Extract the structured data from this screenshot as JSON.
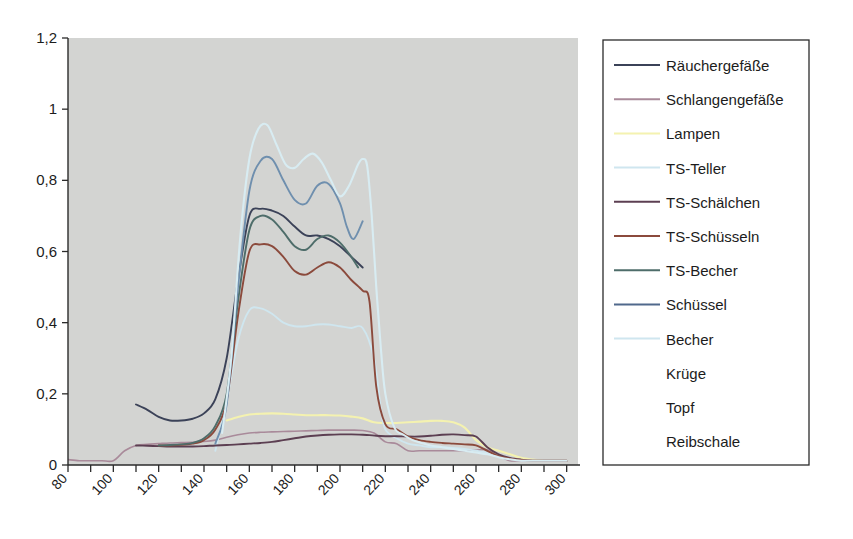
{
  "chart_data": {
    "type": "line",
    "title": "",
    "xlabel": "",
    "ylabel": "",
    "xlim": [
      80,
      305
    ],
    "ylim": [
      0,
      1.2
    ],
    "yticks": [
      0,
      0.2,
      0.4,
      0.6,
      0.8,
      1,
      1.2
    ],
    "ytick_labels": [
      "0",
      "0,2",
      "0,4",
      "0,6",
      "0,8",
      "1",
      "1,2"
    ],
    "xticks": [
      80,
      90,
      100,
      110,
      120,
      130,
      140,
      150,
      160,
      170,
      180,
      190,
      200,
      210,
      220,
      230,
      240,
      250,
      260,
      270,
      280,
      290,
      300
    ],
    "xtick_labels_major": [
      "80",
      "100",
      "120",
      "140",
      "160",
      "180",
      "200",
      "220",
      "240",
      "260",
      "280",
      "300"
    ],
    "xticks_major": [
      80,
      100,
      120,
      140,
      160,
      180,
      200,
      220,
      240,
      260,
      280,
      300
    ],
    "grid": false,
    "legend_position": "right",
    "plot_background": "#d3d4d2",
    "series": [
      {
        "name": "Räuchergefäße",
        "color": "#3b4258",
        "width": 1.9,
        "x": [
          110,
          115,
          120,
          125,
          130,
          135,
          140,
          145,
          150,
          155,
          160,
          165,
          170,
          175,
          180,
          185,
          190,
          195,
          200,
          205,
          210
        ],
        "y": [
          0.17,
          0.155,
          0.135,
          0.125,
          0.125,
          0.13,
          0.145,
          0.185,
          0.3,
          0.52,
          0.7,
          0.72,
          0.715,
          0.7,
          0.67,
          0.645,
          0.645,
          0.635,
          0.615,
          0.585,
          0.555
        ]
      },
      {
        "name": "Schlangengefäße",
        "color": "#a98a9a",
        "width": 1.6,
        "x": [
          80,
          85,
          90,
          95,
          100,
          105,
          110,
          115,
          120,
          125,
          130,
          135,
          140,
          145,
          150,
          155,
          160,
          165,
          170,
          175,
          180,
          185,
          190,
          195,
          200,
          205,
          210,
          215,
          220,
          225,
          230,
          235,
          240,
          245,
          250,
          255,
          260,
          265,
          270,
          275,
          280,
          285,
          290,
          295,
          300
        ],
        "y": [
          0.015,
          0.012,
          0.012,
          0.012,
          0.012,
          0.04,
          0.055,
          0.058,
          0.06,
          0.062,
          0.063,
          0.064,
          0.066,
          0.07,
          0.078,
          0.085,
          0.09,
          0.092,
          0.093,
          0.094,
          0.095,
          0.096,
          0.097,
          0.098,
          0.098,
          0.098,
          0.097,
          0.09,
          0.065,
          0.06,
          0.04,
          0.04,
          0.04,
          0.04,
          0.04,
          0.04,
          0.042,
          0.043,
          0.025,
          0.012,
          0.012,
          0.012,
          0.012,
          0.012,
          0.012
        ]
      },
      {
        "name": "Lampen",
        "color": "#f4f2b0",
        "width": 2.1,
        "x": [
          150,
          155,
          160,
          165,
          170,
          175,
          180,
          185,
          190,
          195,
          200,
          205,
          210,
          215,
          220,
          225,
          230,
          235,
          240,
          245,
          250,
          255,
          260,
          265,
          270,
          275,
          280,
          285,
          290,
          295,
          300
        ],
        "y": [
          0.125,
          0.135,
          0.142,
          0.144,
          0.145,
          0.144,
          0.142,
          0.14,
          0.14,
          0.14,
          0.139,
          0.136,
          0.131,
          0.12,
          0.118,
          0.118,
          0.12,
          0.122,
          0.124,
          0.124,
          0.12,
          0.105,
          0.07,
          0.05,
          0.04,
          0.03,
          0.02,
          0.015,
          0.012,
          0.012,
          0.012
        ]
      },
      {
        "name": "TS-Teller",
        "color": "#cfe6ef",
        "width": 1.9,
        "x": [
          145,
          150,
          155,
          160,
          165,
          170,
          175,
          180,
          185,
          190,
          195,
          200,
          205,
          210,
          215,
          218,
          220,
          225,
          230,
          235,
          240,
          245,
          250,
          255,
          260,
          265,
          270,
          275,
          280,
          285,
          290,
          295,
          300
        ],
        "y": [
          0.04,
          0.18,
          0.35,
          0.435,
          0.44,
          0.425,
          0.4,
          0.39,
          0.39,
          0.395,
          0.395,
          0.39,
          0.385,
          0.385,
          0.3,
          0.16,
          0.1,
          0.075,
          0.06,
          0.055,
          0.05,
          0.05,
          0.048,
          0.045,
          0.04,
          0.035,
          0.028,
          0.02,
          0.014,
          0.012,
          0.012,
          0.012,
          0.012
        ]
      },
      {
        "name": "TS-Schälchen",
        "color": "#5c3f52",
        "width": 1.9,
        "x": [
          110,
          115,
          120,
          125,
          130,
          135,
          140,
          145,
          150,
          155,
          160,
          165,
          170,
          175,
          180,
          185,
          190,
          195,
          200,
          205,
          210,
          213,
          216,
          220,
          225,
          230,
          235,
          240,
          245,
          250,
          255,
          260,
          265,
          270,
          275,
          280,
          285,
          290,
          295,
          300
        ],
        "y": [
          0.055,
          0.054,
          0.053,
          0.052,
          0.052,
          0.052,
          0.053,
          0.055,
          0.056,
          0.058,
          0.06,
          0.062,
          0.065,
          0.07,
          0.075,
          0.08,
          0.083,
          0.085,
          0.086,
          0.086,
          0.085,
          0.084,
          0.082,
          0.081,
          0.081,
          0.08,
          0.08,
          0.082,
          0.085,
          0.086,
          0.084,
          0.08,
          0.05,
          0.03,
          0.02,
          0.015,
          0.012,
          0.012,
          0.012,
          0.012
        ]
      },
      {
        "name": "TS-Schüsseln",
        "color": "#8b4a3c",
        "width": 1.9,
        "x": [
          120,
          125,
          130,
          135,
          140,
          145,
          150,
          155,
          160,
          165,
          170,
          175,
          180,
          185,
          190,
          195,
          200,
          205,
          210,
          213,
          216,
          220,
          225,
          230,
          235,
          240,
          245,
          250,
          255,
          260,
          265,
          270,
          275,
          280,
          285,
          290,
          295,
          300
        ],
        "y": [
          0.055,
          0.055,
          0.057,
          0.06,
          0.07,
          0.1,
          0.18,
          0.42,
          0.6,
          0.62,
          0.615,
          0.585,
          0.545,
          0.535,
          0.555,
          0.57,
          0.555,
          0.52,
          0.49,
          0.46,
          0.22,
          0.115,
          0.1,
          0.08,
          0.07,
          0.065,
          0.062,
          0.06,
          0.058,
          0.055,
          0.04,
          0.025,
          0.018,
          0.014,
          0.012,
          0.012,
          0.012,
          0.012
        ]
      },
      {
        "name": "TS-Becher",
        "color": "#4e6d6a",
        "width": 1.9,
        "x": [
          120,
          125,
          130,
          135,
          140,
          145,
          150,
          155,
          160,
          165,
          170,
          175,
          180,
          185,
          190,
          195,
          200,
          205,
          208
        ],
        "y": [
          0.055,
          0.056,
          0.058,
          0.062,
          0.075,
          0.11,
          0.2,
          0.46,
          0.66,
          0.7,
          0.69,
          0.655,
          0.615,
          0.605,
          0.635,
          0.645,
          0.625,
          0.585,
          0.555
        ]
      },
      {
        "name": "Schüssel",
        "color": "#6f8fae",
        "width": 1.9,
        "x": [
          145,
          150,
          155,
          160,
          165,
          170,
          175,
          180,
          185,
          190,
          195,
          200,
          203,
          206,
          210
        ],
        "y": [
          0.06,
          0.17,
          0.5,
          0.77,
          0.855,
          0.86,
          0.8,
          0.745,
          0.735,
          0.785,
          0.79,
          0.735,
          0.67,
          0.635,
          0.685
        ]
      },
      {
        "name": "Becher",
        "color": "#d8ecf2",
        "width": 2.1,
        "x": [
          148,
          152,
          156,
          160,
          164,
          168,
          172,
          176,
          180,
          184,
          188,
          192,
          196,
          200,
          204,
          208,
          210,
          212,
          214,
          216,
          218,
          220,
          224,
          228,
          232,
          236,
          240,
          245,
          250,
          255,
          260,
          265,
          270,
          275,
          280,
          285,
          290,
          295,
          300
        ],
        "y": [
          0.09,
          0.3,
          0.64,
          0.86,
          0.945,
          0.955,
          0.9,
          0.845,
          0.835,
          0.86,
          0.875,
          0.85,
          0.8,
          0.755,
          0.785,
          0.845,
          0.86,
          0.84,
          0.7,
          0.5,
          0.33,
          0.2,
          0.105,
          0.085,
          0.07,
          0.062,
          0.055,
          0.05,
          0.045,
          0.04,
          0.035,
          0.03,
          0.022,
          0.016,
          0.012,
          0.012,
          0.012,
          0.012,
          0.012
        ]
      },
      {
        "name": "Krüge",
        "color": "none",
        "width": 0,
        "x": [],
        "y": []
      },
      {
        "name": "Topf",
        "color": "none",
        "width": 0,
        "x": [],
        "y": []
      },
      {
        "name": "Reibschale",
        "color": "none",
        "width": 0,
        "x": [],
        "y": []
      }
    ]
  },
  "legend": {
    "entries": [
      {
        "label": "Räuchergefäße",
        "color": "#3b4258",
        "has_line": true
      },
      {
        "label": "Schlangengefäße",
        "color": "#a98a9a",
        "has_line": true
      },
      {
        "label": "Lampen",
        "color": "#f4f2b0",
        "has_line": true
      },
      {
        "label": "TS-Teller",
        "color": "#cfe6ef",
        "has_line": true
      },
      {
        "label": "TS-Schälchen",
        "color": "#5c3f52",
        "has_line": true
      },
      {
        "label": "TS-Schüsseln",
        "color": "#8b4a3c",
        "has_line": true
      },
      {
        "label": "TS-Becher",
        "color": "#4e6d6a",
        "has_line": true
      },
      {
        "label": "Schüssel",
        "color": "#50698c",
        "has_line": true
      },
      {
        "label": "Becher",
        "color": "#cfe6ef",
        "has_line": true
      },
      {
        "label": "Krüge",
        "color": "none",
        "has_line": false
      },
      {
        "label": "Topf",
        "color": "none",
        "has_line": false
      },
      {
        "label": "Reibschale",
        "color": "none",
        "has_line": false
      }
    ]
  },
  "colors": {
    "plot_background": "#d3d4d2",
    "page_background": "#ffffff",
    "axis": "#2b2b2b",
    "text": "#1c1c1c"
  }
}
